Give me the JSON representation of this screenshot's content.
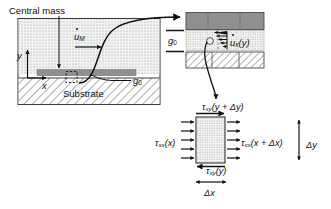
{
  "figure": {
    "left_diagram": {
      "central_mass_label": "Central mass",
      "mass_velocity_label": "u",
      "mass_velocity_sub": "M",
      "y_axis_label": "y",
      "x_axis_label": "x",
      "gap_label": "g",
      "gap_sub": "0",
      "substrate_label": "Substrate"
    },
    "inset": {
      "gap_label": "g",
      "gap_sub": "0",
      "velocity_profile_label": "u",
      "velocity_profile_sub": "x",
      "velocity_profile_arg": "(y)"
    },
    "stress_element": {
      "tau_top_sym": "τ",
      "tau_top_sub": "xy",
      "tau_top_arg": "(y + Δy)",
      "tau_left_sym": "τ",
      "tau_left_sub": "xx",
      "tau_left_arg": "(x)",
      "tau_right_sym": "τ",
      "tau_right_sub": "xx",
      "tau_right_arg": "(x + Δx)",
      "tau_bottom_sym": "τ",
      "tau_bottom_sub": "xy",
      "tau_bottom_arg": "(y)",
      "delta_y_label": "Δy",
      "delta_x_label": "Δx"
    },
    "colors": {
      "ink": "#111111",
      "mass_fill": "#8f8f8f",
      "gap_fill": "#ededed",
      "substrate_fill": "#ffffff",
      "frame": "#4a4a4a",
      "background": "#ffffff"
    }
  }
}
